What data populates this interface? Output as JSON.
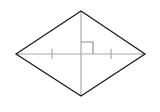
{
  "figure": {
    "name": "rhombus-with-diagonals",
    "background_color": "#ffffff",
    "outline_color": "#1d1d1d",
    "outline_width": 1.3,
    "diagonal_color": "#a8a8a8",
    "diagonal_width": 1.2,
    "tick_color": "#a8a8a8",
    "tick_width": 1.2,
    "right_angle_color": "#8f8f8f",
    "right_angle_width": 1.2,
    "vertices": {
      "left": {
        "x": 16,
        "y": 54
      },
      "top": {
        "x": 81,
        "y": 11
      },
      "right": {
        "x": 145,
        "y": 54
      },
      "bottom": {
        "x": 81,
        "y": 96
      }
    },
    "center": {
      "x": 81,
      "y": 54
    },
    "outline_path": "M 16 54 L 81 11 L 145 54 L 81 96 Z",
    "horizontal_diagonal": {
      "x1": 16,
      "y1": 54,
      "x2": 145,
      "y2": 54
    },
    "vertical_diagonal": {
      "x1": 81,
      "y1": 11,
      "x2": 81,
      "y2": 96
    },
    "tick_marks": [
      {
        "label": "left-congruence-tick",
        "x": 52,
        "y1": 49,
        "y2": 59
      },
      {
        "label": "right-congruence-tick",
        "x": 111,
        "y1": 49,
        "y2": 59
      }
    ],
    "right_angle_marker": {
      "label": "right-angle-square",
      "path": "M 81 42 L 93 42 L 93 54",
      "size": 12,
      "quadrant": "upper-right"
    }
  }
}
